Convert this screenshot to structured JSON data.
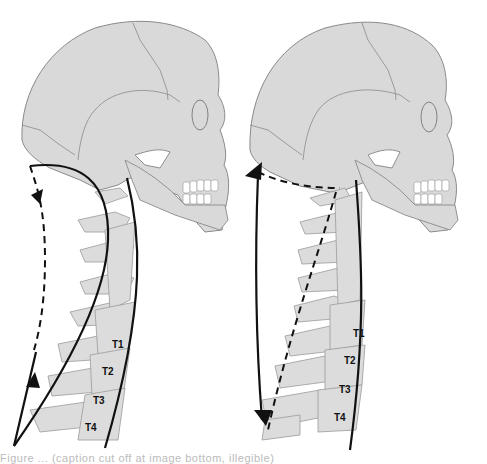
{
  "figure": {
    "panels": [
      {
        "id": "left",
        "description": "skull-and-cervical-spine-flexion",
        "vertebra_labels": [
          "T1",
          "T2",
          "T3",
          "T4"
        ],
        "arrows": [
          "dashed-arc-downward",
          "solid-upward"
        ]
      },
      {
        "id": "right",
        "description": "skull-and-cervical-spine-extension",
        "vertebra_labels": [
          "T1",
          "T2",
          "T3",
          "T4"
        ],
        "arrows": [
          "solid-upward-to-occiput",
          "solid-downward"
        ]
      }
    ],
    "caption_text": "Figure ... (caption cut off at image bottom, illegible)"
  },
  "colors": {
    "bone_fill": "#d9d9d9",
    "bone_stroke": "#8a8a8a",
    "line": "#111111",
    "background": "#ffffff"
  }
}
